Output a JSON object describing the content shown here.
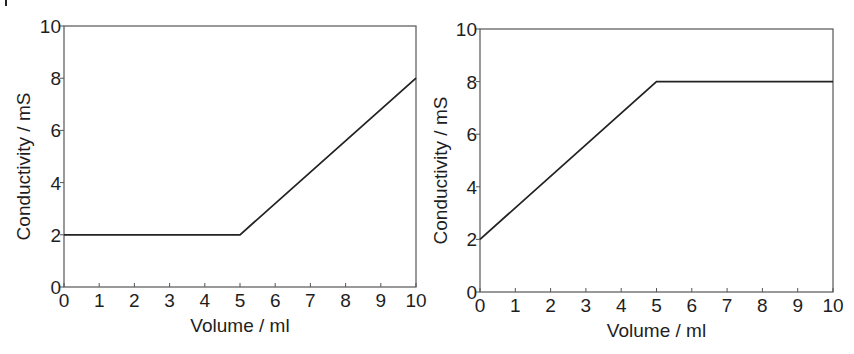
{
  "figure": {
    "line_color": "#222222",
    "axis_color": "#555555",
    "text_color": "#1e1e1e"
  },
  "chart_data": [
    {
      "type": "line",
      "title": "",
      "xlabel": "Volume / ml",
      "ylabel": "Conductivity / mS",
      "xlim": [
        0,
        10
      ],
      "ylim": [
        0,
        10
      ],
      "xticks": [
        "0",
        "1",
        "2",
        "3",
        "4",
        "5",
        "6",
        "7",
        "8",
        "9",
        "10"
      ],
      "yticks": [
        "0",
        "2",
        "4",
        "6",
        "8",
        "10"
      ],
      "grid": false,
      "legend": null,
      "series": [
        {
          "name": "conductivity",
          "x": [
            0,
            5,
            10
          ],
          "y": [
            2,
            2,
            8
          ]
        }
      ]
    },
    {
      "type": "line",
      "title": "",
      "xlabel": "Volume / ml",
      "ylabel": "Conductivity / mS",
      "xlim": [
        0,
        10
      ],
      "ylim": [
        0,
        10
      ],
      "xticks": [
        "0",
        "1",
        "2",
        "3",
        "4",
        "5",
        "6",
        "7",
        "8",
        "9",
        "10"
      ],
      "yticks": [
        "0",
        "2",
        "4",
        "6",
        "8",
        "10"
      ],
      "grid": false,
      "legend": null,
      "series": [
        {
          "name": "conductivity",
          "x": [
            0,
            5,
            10
          ],
          "y": [
            2,
            8,
            8
          ]
        }
      ]
    }
  ]
}
